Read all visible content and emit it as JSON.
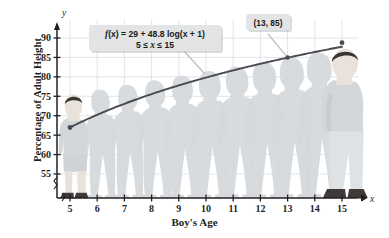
{
  "chart_data": {
    "type": "line",
    "title": "",
    "xlabel": "Boy's Age",
    "ylabel": "Percentage of Adult Height",
    "xlim": [
      4.45,
      15.85
    ],
    "ylim": [
      52.0,
      92.5
    ],
    "xticks": [
      "5",
      "6",
      "7",
      "8",
      "9",
      "10",
      "11",
      "12",
      "13",
      "14",
      "15"
    ],
    "xtick_values": [
      5,
      6,
      7,
      8,
      9,
      10,
      11,
      12,
      13,
      14,
      15
    ],
    "yticks": [
      "55",
      "60",
      "65",
      "70",
      "75",
      "80",
      "85",
      "90"
    ],
    "ytick_values": [
      55,
      60,
      65,
      70,
      75,
      80,
      85,
      90
    ],
    "grid": true,
    "legend": "none",
    "axis_break": true,
    "x_axis_name": "x",
    "y_axis_name": "y",
    "series": [
      {
        "name": "f(x) = 29 + 48.8 log(x + 1)",
        "x": [
          5,
          6,
          7,
          8,
          9,
          10,
          11,
          12,
          13,
          14,
          15
        ],
        "values": [
          66.97,
          70.21,
          73.09,
          75.67,
          78.0,
          80.15,
          82.13,
          83.97,
          85.68,
          87.29,
          88.8
        ]
      }
    ],
    "annotations": [
      {
        "name": "formula-callout",
        "line1_prefix": "f",
        "line1": "(x) = 29 + 48.8 log(x + 1)",
        "line2": "5 ≤ x ≤ 15",
        "line2_pre": "5 ≤ ",
        "line2_var": "x",
        "line2_post": " ≤ 15"
      },
      {
        "name": "point-label",
        "text": "(13, 85)",
        "point_x": 13,
        "point_y": 85
      }
    ],
    "figures": [
      {
        "age": 5,
        "style": "detailed-boy"
      },
      {
        "age": 6,
        "style": "silhouette"
      },
      {
        "age": 7,
        "style": "silhouette"
      },
      {
        "age": 8,
        "style": "silhouette"
      },
      {
        "age": 9,
        "style": "silhouette"
      },
      {
        "age": 10,
        "style": "silhouette"
      },
      {
        "age": 11,
        "style": "silhouette"
      },
      {
        "age": 12,
        "style": "silhouette"
      },
      {
        "age": 13,
        "style": "silhouette"
      },
      {
        "age": 14,
        "style": "silhouette"
      },
      {
        "age": 15,
        "style": "detailed-teen"
      }
    ],
    "colors": {
      "curve": "#4a4a52",
      "grid": "#d9dde2",
      "axis": "#231f20",
      "silhouette": "#d5d9dc",
      "callout_bg": "#e2e4e6",
      "skin": "#e8e2da",
      "shirt": "#d3d7da",
      "pants": "#dfe2e4",
      "hair": "#3a3430",
      "shoe": "#3d3a38"
    }
  }
}
